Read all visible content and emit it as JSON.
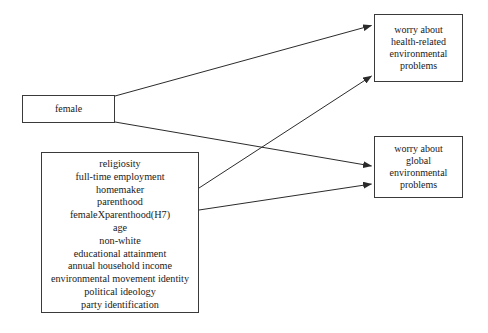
{
  "diagram": {
    "type": "conceptual-path-model",
    "background_color": "#ffffff",
    "line_color": "#2b2b2b",
    "box_border_color": "#3a3a3a",
    "nodes": {
      "female": {
        "id": "female",
        "role": "focal-predictor",
        "lines": [
          "female"
        ]
      },
      "controls": {
        "id": "controls",
        "role": "control-variables",
        "lines": [
          "religiosity",
          "full-time employment",
          "homemaker",
          "parenthood",
          "femaleXparenthood(H7)",
          "age",
          "non-white",
          "educational attainment",
          "annual household income",
          "environmental movement identity",
          "political ideology",
          "party identification"
        ]
      },
      "health_outcome": {
        "id": "health_outcome",
        "role": "outcome",
        "lines": [
          "worry about",
          "health-related",
          "environmental",
          "problems"
        ]
      },
      "global_outcome": {
        "id": "global_outcome",
        "role": "outcome",
        "lines": [
          "worry about",
          "global",
          "environmental",
          "problems"
        ]
      }
    },
    "edges": [
      {
        "id": "female-to-health",
        "from": "female",
        "to": "health_outcome",
        "arrowhead": true
      },
      {
        "id": "female-to-global",
        "from": "female",
        "to": "global_outcome",
        "arrowhead": true
      },
      {
        "id": "controls-to-health",
        "from": "controls",
        "to": "health_outcome",
        "arrowhead": true
      },
      {
        "id": "controls-to-global",
        "from": "controls",
        "to": "global_outcome",
        "arrowhead": true
      }
    ]
  }
}
